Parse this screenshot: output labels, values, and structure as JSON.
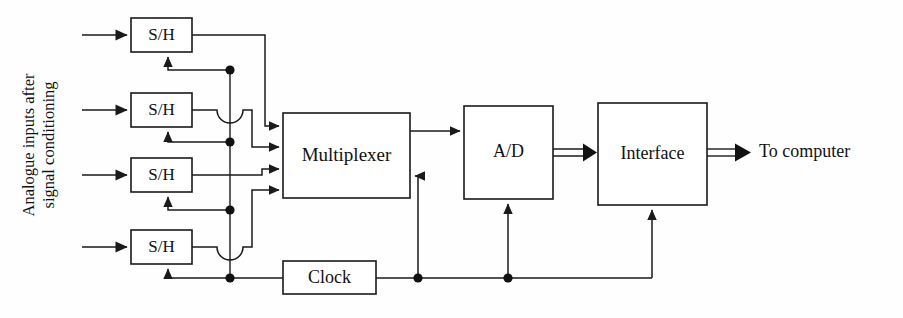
{
  "diagram": {
    "background_color": "#fefefe",
    "line_color": "#1a1a1a",
    "side_label": {
      "line1": "Analogue inputs after",
      "line2": "signal conditioning",
      "rotation": "-90"
    },
    "blocks": [
      {
        "id": "sh1",
        "label": "S/H",
        "x": 131,
        "y": 18,
        "w": 61,
        "h": 34
      },
      {
        "id": "sh2",
        "label": "S/H",
        "x": 131,
        "y": 93,
        "w": 61,
        "h": 34
      },
      {
        "id": "sh3",
        "label": "S/H",
        "x": 131,
        "y": 158,
        "w": 61,
        "h": 34
      },
      {
        "id": "sh4",
        "label": "S/H",
        "x": 131,
        "y": 230,
        "w": 61,
        "h": 34
      },
      {
        "id": "mux",
        "label": "Multiplexer",
        "x": 283,
        "y": 113,
        "w": 127,
        "h": 85
      },
      {
        "id": "adc",
        "label": "A/D",
        "x": 464,
        "y": 106,
        "w": 89,
        "h": 93
      },
      {
        "id": "iface",
        "label": "Interface",
        "x": 598,
        "y": 103,
        "w": 109,
        "h": 102
      },
      {
        "id": "clock",
        "label": "Clock",
        "x": 283,
        "y": 261,
        "w": 93,
        "h": 33
      }
    ],
    "output_label": "To computer",
    "input_arrow_count": 4,
    "bus_arrows": [
      {
        "from": "adc",
        "to": "iface",
        "style": "double-line-bus"
      },
      {
        "from": "iface",
        "to": "computer",
        "style": "double-line-bus"
      }
    ],
    "clock_bus": {
      "vertical_x": 230,
      "horizontal_y": 278,
      "junction_dots": [
        {
          "x": 230,
          "y": 70
        },
        {
          "x": 230,
          "y": 142
        },
        {
          "x": 230,
          "y": 210
        },
        {
          "x": 230,
          "y": 278
        },
        {
          "x": 418,
          "y": 278
        },
        {
          "x": 508,
          "y": 278
        }
      ]
    },
    "line_hops": [
      {
        "x": 230,
        "y": 110,
        "r": 13
      },
      {
        "x": 230,
        "y": 247,
        "r": 13
      }
    ]
  }
}
